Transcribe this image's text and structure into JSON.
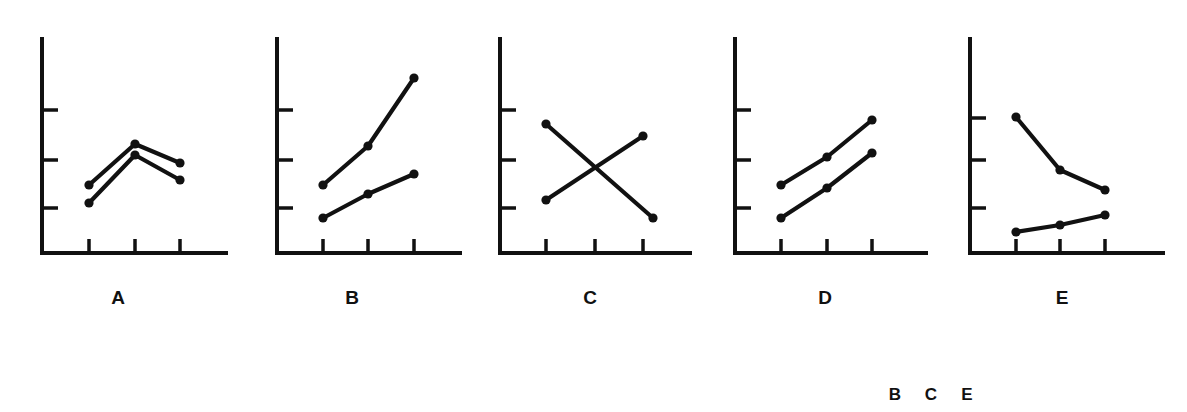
{
  "figure": {
    "title": "",
    "background_color": "#ffffff",
    "ink_color": "#111111",
    "panel_count": 5
  },
  "panel_labels": [
    {
      "text": "A",
      "x": 118,
      "y": 288
    },
    {
      "text": "B",
      "x": 352,
      "y": 288
    },
    {
      "text": "C",
      "x": 590,
      "y": 288
    },
    {
      "text": "D",
      "x": 825,
      "y": 288
    },
    {
      "text": "E",
      "x": 1062,
      "y": 288
    }
  ],
  "footer_letters": [
    {
      "text": "B",
      "x": 895,
      "y": 386
    },
    {
      "text": "C",
      "x": 931,
      "y": 386
    },
    {
      "text": "E",
      "x": 967,
      "y": 386
    }
  ],
  "chart_data": [
    {
      "id": "A",
      "type": "line",
      "title": "A",
      "xlabel": "",
      "ylabel": "",
      "grid": false,
      "legend": "none",
      "x": [
        1,
        2,
        3
      ],
      "xlim": [
        0.5,
        3.6
      ],
      "ylim": [
        0,
        5
      ],
      "yticks": [
        1,
        2,
        3
      ],
      "xticks": [
        1,
        2,
        3
      ],
      "series": [
        {
          "name": "upper",
          "values": [
            1.58,
            2.53,
            2.09
          ]
        },
        {
          "name": "lower",
          "values": [
            1.16,
            2.28,
            1.7
          ]
        }
      ],
      "pattern": "both rise to a peak at the middle level then fall; lines nearly parallel, no interaction"
    },
    {
      "id": "B",
      "type": "line",
      "title": "B",
      "xlabel": "",
      "ylabel": "",
      "grid": false,
      "legend": "none",
      "x": [
        1,
        2,
        3
      ],
      "xlim": [
        0.5,
        3.6
      ],
      "ylim": [
        0,
        5
      ],
      "yticks": [
        1,
        2,
        3
      ],
      "xticks": [
        1,
        2,
        3
      ],
      "series": [
        {
          "name": "upper",
          "values": [
            1.72,
            2.86,
            4.05
          ]
        },
        {
          "name": "lower",
          "values": [
            1.09,
            1.81,
            2.3
          ]
        }
      ],
      "pattern": "both rise but the upper line rises faster; lines diverge, interaction present"
    },
    {
      "id": "C",
      "type": "line",
      "title": "C",
      "xlabel": "",
      "ylabel": "",
      "grid": false,
      "legend": "none",
      "x": [
        1,
        3
      ],
      "xlim": [
        0.5,
        3.6
      ],
      "ylim": [
        0,
        5
      ],
      "yticks": [
        1,
        2,
        3
      ],
      "xticks": [
        1,
        2,
        3
      ],
      "series": [
        {
          "name": "falling",
          "values": [
            2.88,
            1.13
          ]
        },
        {
          "name": "rising",
          "values": [
            1.44,
            2.55
          ]
        }
      ],
      "pattern": "one line falls while the other rises; the lines cross, a crossover interaction"
    },
    {
      "id": "D",
      "type": "line",
      "title": "D",
      "xlabel": "",
      "ylabel": "",
      "grid": false,
      "legend": "none",
      "x": [
        1,
        2,
        3
      ],
      "xlim": [
        0.5,
        3.6
      ],
      "ylim": [
        0,
        5
      ],
      "yticks": [
        1,
        2,
        3
      ],
      "xticks": [
        1,
        2,
        3
      ],
      "series": [
        {
          "name": "upper",
          "values": [
            1.79,
            2.46,
            3.07
          ]
        },
        {
          "name": "lower",
          "values": [
            1.14,
            1.81,
            2.44
          ]
        }
      ],
      "pattern": "two parallel rising lines; no interaction"
    },
    {
      "id": "E",
      "type": "line",
      "title": "E",
      "xlabel": "",
      "ylabel": "",
      "grid": false,
      "legend": "none",
      "x": [
        1,
        2,
        3
      ],
      "xlim": [
        0.5,
        3.6
      ],
      "ylim": [
        0,
        5
      ],
      "yticks": [
        1,
        2,
        3
      ],
      "xticks": [
        1,
        2,
        3
      ],
      "series": [
        {
          "name": "upper",
          "values": [
            3.05,
            1.96,
            1.75
          ]
        },
        {
          "name": "lower",
          "values": [
            0.87,
            0.99,
            1.1
          ]
        }
      ],
      "pattern": "upper line falls steeply while the lower line rises slightly; lines converge, interaction present"
    }
  ],
  "panel_geometry": [
    {
      "id": "A",
      "axis_x": 42,
      "axis_top": 37,
      "axis_bottom": 253,
      "axis_right": 228,
      "yticks_px": [
        110,
        160,
        208
      ],
      "xticks_px": [
        89,
        135,
        180
      ],
      "series_px": [
        [
          [
            89,
            185
          ],
          [
            135,
            144
          ],
          [
            180,
            163
          ]
        ],
        [
          [
            89,
            203
          ],
          [
            135,
            155
          ],
          [
            180,
            180
          ]
        ]
      ]
    },
    {
      "id": "B",
      "axis_x": 277,
      "axis_top": 37,
      "axis_bottom": 253,
      "axis_right": 462,
      "yticks_px": [
        110,
        160,
        208
      ],
      "xticks_px": [
        323,
        368,
        414
      ],
      "series_px": [
        [
          [
            323,
            185
          ],
          [
            368,
            146
          ],
          [
            414,
            78
          ]
        ],
        [
          [
            323,
            218
          ],
          [
            368,
            194
          ],
          [
            414,
            174
          ]
        ]
      ]
    },
    {
      "id": "C",
      "axis_x": 500,
      "axis_top": 37,
      "axis_bottom": 253,
      "axis_right": 692,
      "yticks_px": [
        110,
        160,
        208
      ],
      "xticks_px": [
        546,
        595,
        643
      ],
      "series_px": [
        [
          [
            546,
            124
          ],
          [
            653,
            218
          ]
        ],
        [
          [
            546,
            200
          ],
          [
            643,
            136
          ]
        ]
      ]
    },
    {
      "id": "D",
      "axis_x": 735,
      "axis_top": 37,
      "axis_bottom": 253,
      "axis_right": 928,
      "yticks_px": [
        110,
        160,
        208
      ],
      "xticks_px": [
        781,
        827,
        872
      ],
      "series_px": [
        [
          [
            781,
            185
          ],
          [
            827,
            157
          ],
          [
            872,
            120
          ]
        ],
        [
          [
            781,
            218
          ],
          [
            827,
            188
          ],
          [
            872,
            153
          ]
        ]
      ]
    },
    {
      "id": "E",
      "axis_x": 970,
      "axis_top": 37,
      "axis_bottom": 253,
      "axis_right": 1165,
      "yticks_px": [
        118,
        212,
        215
      ],
      "yticks_px_fixed": [
        118,
        160,
        208
      ],
      "xticks_px": [
        1016,
        1060,
        1105
      ],
      "series_px": [
        [
          [
            1016,
            117
          ],
          [
            1060,
            170
          ],
          [
            1105,
            190
          ]
        ],
        [
          [
            1016,
            232
          ],
          [
            1060,
            225
          ],
          [
            1105,
            215
          ]
        ]
      ]
    }
  ]
}
